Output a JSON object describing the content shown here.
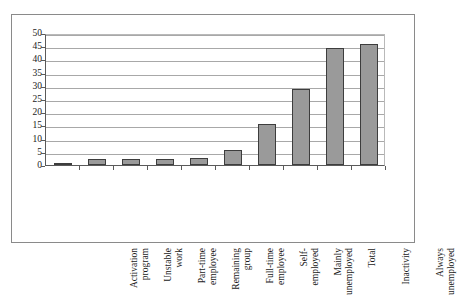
{
  "chart_data": {
    "type": "bar",
    "title": "",
    "xlabel": "",
    "ylabel": "",
    "ylim": [
      0,
      50
    ],
    "yticks": [
      0,
      5,
      10,
      15,
      20,
      25,
      30,
      35,
      40,
      45,
      50
    ],
    "grid": true,
    "legend": "none",
    "bar_color": "#9a9a9a",
    "bar_border_color": "#3d3d3d",
    "categories": [
      "Activation program",
      "Unstable work",
      "Part-time employee",
      "Remaining group",
      "Full-time employee",
      "Self-employed",
      "Mainly unemployed",
      "Total",
      "Inactivity",
      "Always unemployed"
    ],
    "category_lines": [
      [
        "Activation",
        "program"
      ],
      [
        "Unstable",
        "work"
      ],
      [
        "Part-time",
        "employee"
      ],
      [
        "Remaining",
        "group"
      ],
      [
        "Full-time",
        "employee"
      ],
      [
        "Self-",
        "employed"
      ],
      [
        "Mainly",
        "unemployed"
      ],
      [
        "Total",
        ""
      ],
      [
        "Inactivity",
        ""
      ],
      [
        "Always",
        "unemployed"
      ]
    ],
    "values": [
      0.6,
      2.3,
      2.2,
      2.1,
      2.8,
      5.7,
      15.6,
      28.7,
      44.2,
      45.7
    ]
  }
}
